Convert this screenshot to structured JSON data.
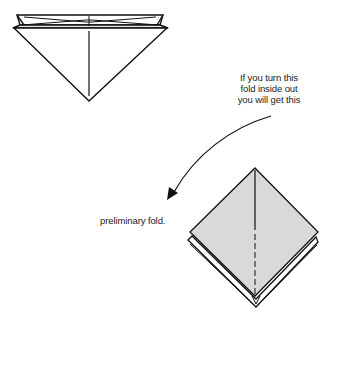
{
  "diagram": {
    "annotation_lines": [
      "If you turn this",
      "fold inside out",
      "you will get this"
    ],
    "result_label": "preliminary fold.",
    "colors": {
      "line": "#111111",
      "paper_fill": "#d9d9d9",
      "background": "#ffffff"
    },
    "figures": [
      {
        "name": "inverted-triangle-fold",
        "description": "triangle with layered top edge (waterbomb base, inside view)"
      },
      {
        "name": "preliminary-fold-diamond",
        "description": "shaded diamond with layered edges and dashed center crease"
      }
    ],
    "arrow": {
      "direction": "curved, from upper right to lower left"
    }
  }
}
